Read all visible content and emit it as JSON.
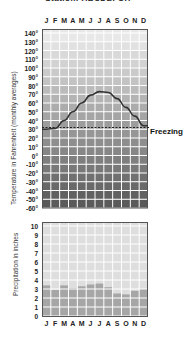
{
  "title": "Station: ABCDEFGH",
  "months": [
    "J",
    "F",
    "M",
    "A",
    "M",
    "J",
    "J",
    "A",
    "S",
    "O",
    "N",
    "D"
  ],
  "temperature": {
    "axis_title": "Temperature in Fahrenheit (monthly averages)",
    "tick_labels": [
      "140°",
      "130°",
      "120°",
      "110°",
      "100°",
      "90°",
      "80°",
      "70°",
      "60°",
      "50°",
      "40°",
      "30°",
      "20°",
      "10°",
      "0°",
      "-10°",
      "-20°",
      "-30°",
      "-40°",
      "-50°",
      "-60°"
    ],
    "freezing_label": "Freezing"
  },
  "precipitation": {
    "axis_title": "Precipitation in inches",
    "tick_labels": [
      "10",
      "9",
      "8",
      "7",
      "6",
      "5",
      "4",
      "3",
      "2",
      "1",
      "0"
    ]
  },
  "chart_data": [
    {
      "type": "line",
      "title": "",
      "xlabel": "",
      "ylabel": "Temperature in Fahrenheit (monthly averages)",
      "categories": [
        "J",
        "F",
        "M",
        "A",
        "M",
        "J",
        "J",
        "A",
        "S",
        "O",
        "N",
        "D"
      ],
      "values": [
        30,
        31,
        40,
        50,
        60,
        69,
        73,
        72,
        65,
        55,
        45,
        34
      ],
      "ylim": [
        -60,
        140
      ],
      "yticks": [
        140,
        130,
        120,
        110,
        100,
        90,
        80,
        70,
        60,
        50,
        40,
        30,
        20,
        10,
        0,
        -10,
        -20,
        -30,
        -40,
        -50,
        -60
      ],
      "reference_line": {
        "label": "Freezing",
        "value": 32,
        "style": "dashed"
      },
      "grid": true
    },
    {
      "type": "bar",
      "title": "",
      "xlabel": "",
      "ylabel": "Precipitation in inches",
      "categories": [
        "J",
        "F",
        "M",
        "A",
        "M",
        "J",
        "J",
        "A",
        "S",
        "O",
        "N",
        "D"
      ],
      "values": [
        3.4,
        2.9,
        3.4,
        3.1,
        3.3,
        3.5,
        3.6,
        3.2,
        2.5,
        2.4,
        2.8,
        3.0
      ],
      "ylim": [
        0,
        10
      ],
      "yticks": [
        0,
        1,
        2,
        3,
        4,
        5,
        6,
        7,
        8,
        9,
        10
      ],
      "grid": true
    }
  ],
  "colors": {
    "grid_light": "#e6e6e6",
    "grid_dark": "#6e6e6e",
    "line": "#333333",
    "bar": "#a9a9a9",
    "border": "#555555"
  }
}
